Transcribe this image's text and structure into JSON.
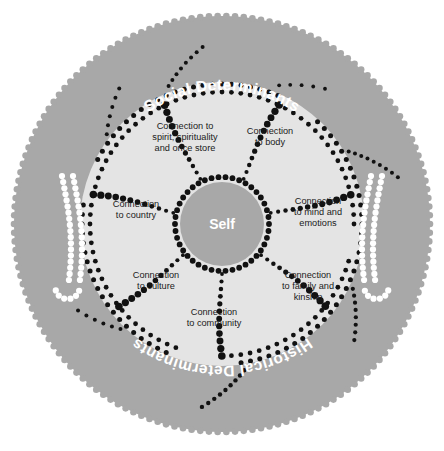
{
  "diagram": {
    "title_top": "Social Determinants",
    "title_bottom": "Historical Determinants",
    "center_label": "Self",
    "segments": [
      {
        "id": "body",
        "label": "Connection\nto body"
      },
      {
        "id": "mind",
        "label": "Connection\nto mind and\nemotions"
      },
      {
        "id": "family",
        "label": "Connection\nto family and\nkinship"
      },
      {
        "id": "community",
        "label": "Connection\nto community"
      },
      {
        "id": "culture",
        "label": "Connection\nto culture"
      },
      {
        "id": "country",
        "label": "Connection\nto country"
      },
      {
        "id": "spirit",
        "label": "Connection to\nspirit, spirituality\nand once store"
      }
    ],
    "colors": {
      "outer_ring": "#a8a8a8",
      "segment_fill": "#e4e4e4",
      "center_fill": "#a8a8a8",
      "dot_dark": "#111111",
      "dot_light": "#ffffff",
      "text_dark": "#1a1a1a",
      "text_light": "#ffffff",
      "background": "#ffffff"
    },
    "arrows": [
      {
        "id": "left-arrow",
        "color": "#ffffff",
        "direction": "down"
      },
      {
        "id": "right-arrow",
        "color": "#ffffff",
        "direction": "down"
      }
    ]
  }
}
